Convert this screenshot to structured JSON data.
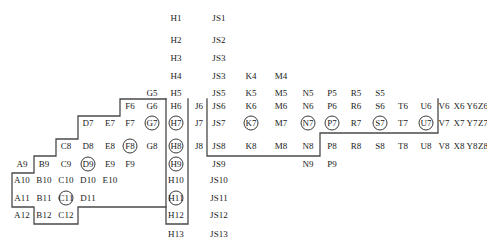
{
  "diagram": {
    "colors": {
      "text": "#1a1a1a",
      "outline": "#4a4a4a",
      "circle": "#3a3a3a",
      "background": "#ffffff"
    },
    "rows": [
      {
        "index": 1,
        "y": 18,
        "cells": [
          {
            "label": "H1",
            "x": 176,
            "circled": false
          },
          {
            "label": "JS1",
            "x": 219,
            "circled": false
          }
        ]
      },
      {
        "index": 2,
        "y": 40,
        "cells": [
          {
            "label": "H2",
            "x": 176,
            "circled": false
          },
          {
            "label": "JS2",
            "x": 219,
            "circled": false
          }
        ]
      },
      {
        "index": 3,
        "y": 58,
        "cells": [
          {
            "label": "H3",
            "x": 176,
            "circled": false
          },
          {
            "label": "JS3",
            "x": 219,
            "circled": false
          }
        ]
      },
      {
        "index": 4,
        "y": 76,
        "cells": [
          {
            "label": "H4",
            "x": 176,
            "circled": false
          },
          {
            "label": "JS3",
            "x": 219,
            "circled": false
          },
          {
            "label": "K4",
            "x": 251,
            "circled": false
          },
          {
            "label": "M4",
            "x": 281,
            "circled": false
          }
        ]
      },
      {
        "index": 5,
        "y": 93,
        "cells": [
          {
            "label": "G5",
            "x": 152,
            "circled": false
          },
          {
            "label": "H5",
            "x": 176,
            "circled": false
          },
          {
            "label": "JS5",
            "x": 219,
            "circled": false
          },
          {
            "label": "K5",
            "x": 251,
            "circled": false
          },
          {
            "label": "M5",
            "x": 281,
            "circled": false
          },
          {
            "label": "N5",
            "x": 308,
            "circled": false
          },
          {
            "label": "P5",
            "x": 332,
            "circled": false
          },
          {
            "label": "R5",
            "x": 356,
            "circled": false
          },
          {
            "label": "S5",
            "x": 380,
            "circled": false
          }
        ]
      },
      {
        "index": 6,
        "y": 106,
        "cells": [
          {
            "label": "F6",
            "x": 130,
            "circled": false
          },
          {
            "label": "G6",
            "x": 152,
            "circled": false
          },
          {
            "label": "H6",
            "x": 176,
            "circled": false
          },
          {
            "label": "J6",
            "x": 199,
            "circled": false
          },
          {
            "label": "JS6",
            "x": 219,
            "circled": false
          },
          {
            "label": "K6",
            "x": 251,
            "circled": false
          },
          {
            "label": "M6",
            "x": 281,
            "circled": false
          },
          {
            "label": "N6",
            "x": 308,
            "circled": false
          },
          {
            "label": "P6",
            "x": 332,
            "circled": false
          },
          {
            "label": "R6",
            "x": 356,
            "circled": false
          },
          {
            "label": "S6",
            "x": 380,
            "circled": false
          },
          {
            "label": "T6",
            "x": 403,
            "circled": false
          },
          {
            "label": "U6",
            "x": 426,
            "circled": false
          },
          {
            "label": "V6",
            "x": 444,
            "circled": false
          },
          {
            "label": "X6",
            "x": 459,
            "circled": false
          },
          {
            "label": "Y6",
            "x": 472,
            "circled": false
          },
          {
            "label": "Z6",
            "x": 483,
            "circled": false
          }
        ]
      },
      {
        "index": 7,
        "y": 123,
        "cells": [
          {
            "label": "D7",
            "x": 88,
            "circled": false
          },
          {
            "label": "E7",
            "x": 110,
            "circled": false
          },
          {
            "label": "F7",
            "x": 130,
            "circled": false
          },
          {
            "label": "G7",
            "x": 152,
            "circled": true
          },
          {
            "label": "H7",
            "x": 176,
            "circled": true
          },
          {
            "label": "J7",
            "x": 199,
            "circled": false
          },
          {
            "label": "JS7",
            "x": 219,
            "circled": false
          },
          {
            "label": "K7",
            "x": 251,
            "circled": true
          },
          {
            "label": "M7",
            "x": 281,
            "circled": false
          },
          {
            "label": "N7",
            "x": 308,
            "circled": true
          },
          {
            "label": "P7",
            "x": 332,
            "circled": true
          },
          {
            "label": "R7",
            "x": 356,
            "circled": false
          },
          {
            "label": "S7",
            "x": 380,
            "circled": true
          },
          {
            "label": "T7",
            "x": 403,
            "circled": false
          },
          {
            "label": "U7",
            "x": 426,
            "circled": true
          },
          {
            "label": "V7",
            "x": 444,
            "circled": false
          },
          {
            "label": "X7",
            "x": 459,
            "circled": false
          },
          {
            "label": "Y7",
            "x": 472,
            "circled": false
          },
          {
            "label": "Z7",
            "x": 483,
            "circled": false
          }
        ]
      },
      {
        "index": 8,
        "y": 146,
        "cells": [
          {
            "label": "C8",
            "x": 66,
            "circled": false
          },
          {
            "label": "D8",
            "x": 88,
            "circled": false
          },
          {
            "label": "E8",
            "x": 110,
            "circled": false
          },
          {
            "label": "F8",
            "x": 130,
            "circled": true
          },
          {
            "label": "G8",
            "x": 152,
            "circled": false
          },
          {
            "label": "H8",
            "x": 176,
            "circled": true
          },
          {
            "label": "J8",
            "x": 199,
            "circled": false
          },
          {
            "label": "JS8",
            "x": 219,
            "circled": false
          },
          {
            "label": "K8",
            "x": 251,
            "circled": false
          },
          {
            "label": "M8",
            "x": 281,
            "circled": false
          },
          {
            "label": "N8",
            "x": 308,
            "circled": false
          },
          {
            "label": "P8",
            "x": 332,
            "circled": false
          },
          {
            "label": "R8",
            "x": 356,
            "circled": false
          },
          {
            "label": "S8",
            "x": 380,
            "circled": false
          },
          {
            "label": "T8",
            "x": 403,
            "circled": false
          },
          {
            "label": "U8",
            "x": 426,
            "circled": false
          },
          {
            "label": "V8",
            "x": 444,
            "circled": false
          },
          {
            "label": "X8",
            "x": 459,
            "circled": false
          },
          {
            "label": "Y8",
            "x": 472,
            "circled": false
          },
          {
            "label": "Z8",
            "x": 483,
            "circled": false
          }
        ]
      },
      {
        "index": 9,
        "y": 164,
        "cells": [
          {
            "label": "A9",
            "x": 22,
            "circled": false
          },
          {
            "label": "B9",
            "x": 44,
            "circled": false
          },
          {
            "label": "C9",
            "x": 66,
            "circled": false
          },
          {
            "label": "D9",
            "x": 88,
            "circled": true
          },
          {
            "label": "E9",
            "x": 110,
            "circled": false
          },
          {
            "label": "F9",
            "x": 130,
            "circled": false
          },
          {
            "label": "H9",
            "x": 176,
            "circled": true
          },
          {
            "label": "JS9",
            "x": 219,
            "circled": false
          },
          {
            "label": "N9",
            "x": 308,
            "circled": false
          },
          {
            "label": "P9",
            "x": 332,
            "circled": false
          }
        ]
      },
      {
        "index": 10,
        "y": 180,
        "cells": [
          {
            "label": "A10",
            "x": 22,
            "circled": false
          },
          {
            "label": "B10",
            "x": 44,
            "circled": false
          },
          {
            "label": "C10",
            "x": 66,
            "circled": false
          },
          {
            "label": "D10",
            "x": 88,
            "circled": false
          },
          {
            "label": "E10",
            "x": 110,
            "circled": false
          },
          {
            "label": "H10",
            "x": 176,
            "circled": false
          },
          {
            "label": "JS10",
            "x": 219,
            "circled": false
          }
        ]
      },
      {
        "index": 11,
        "y": 198,
        "cells": [
          {
            "label": "A11",
            "x": 22,
            "circled": false
          },
          {
            "label": "B11",
            "x": 44,
            "circled": false
          },
          {
            "label": "C11",
            "x": 66,
            "circled": true
          },
          {
            "label": "D11",
            "x": 88,
            "circled": false
          },
          {
            "label": "H11",
            "x": 176,
            "circled": true
          },
          {
            "label": "JS11",
            "x": 219,
            "circled": false
          }
        ]
      },
      {
        "index": 12,
        "y": 215,
        "cells": [
          {
            "label": "A12",
            "x": 22,
            "circled": false
          },
          {
            "label": "B12",
            "x": 44,
            "circled": false
          },
          {
            "label": "C12",
            "x": 66,
            "circled": false
          },
          {
            "label": "H12",
            "x": 176,
            "circled": false
          },
          {
            "label": "JS12",
            "x": 219,
            "circled": false
          }
        ]
      },
      {
        "index": 13,
        "y": 234,
        "cells": [
          {
            "label": "H13",
            "x": 176,
            "circled": false
          },
          {
            "label": "JS13",
            "x": 219,
            "circled": false
          }
        ]
      }
    ],
    "regions": [
      {
        "name": "left-staircase-region",
        "points": "166,99 120,99 120,116 78,116 78,139 56,139 56,156 34,156 34,173 12,173 12,207 34,207 34,224 78,224 78,207 166,207"
      },
      {
        "name": "h-column-region",
        "points": "166,99 166,224 188,224 188,99"
      },
      {
        "name": "right-block-region",
        "points": "207,99 207,156 320,156 320,133 438,133 438,99"
      }
    ]
  }
}
